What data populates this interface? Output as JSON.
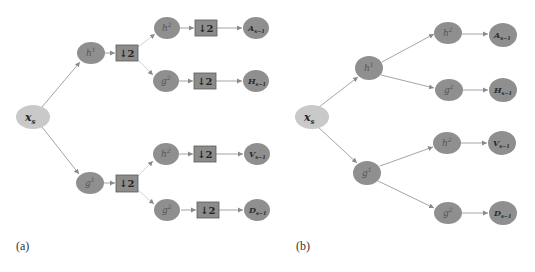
{
  "colors": {
    "input_node_fill": "#c9c9c9",
    "node_fill": "#8f8f8f",
    "downsample_box_fill": "#8c8c8c",
    "downsample_box_stroke": "#5a5a5a",
    "edge_color": "#9a9a9a",
    "edge_light": "#cfcfcf"
  },
  "panels": [
    {
      "label": "(a)",
      "input": {
        "label": "x",
        "sub": "s"
      },
      "level1": [
        {
          "id": "h1",
          "label": "h",
          "sup": "1",
          "downsample": "2"
        },
        {
          "id": "g1",
          "label": "g",
          "sup": "1",
          "downsample": "2"
        }
      ],
      "level2": [
        {
          "id": "h2a",
          "label": "h",
          "sup": "2",
          "downsample": "2",
          "output": {
            "label": "A",
            "sub": "s−1"
          }
        },
        {
          "id": "g2a",
          "label": "g",
          "sup": "2",
          "downsample": "2",
          "output": {
            "label": "H",
            "sub": "s−1"
          }
        },
        {
          "id": "h2b",
          "label": "h",
          "sup": "2",
          "downsample": "2",
          "output": {
            "label": "V",
            "sub": "s−1"
          }
        },
        {
          "id": "g2b",
          "label": "g",
          "sup": "2",
          "downsample": "2",
          "output": {
            "label": "D",
            "sub": "s−1"
          }
        }
      ]
    },
    {
      "label": "(b)",
      "input": {
        "label": "x",
        "sub": "s"
      },
      "level1": [
        {
          "id": "h1",
          "label": "h",
          "sup": "1"
        },
        {
          "id": "g1",
          "label": "g",
          "sup": "1"
        }
      ],
      "level2": [
        {
          "id": "h2a",
          "label": "h",
          "sup": "2",
          "output": {
            "label": "A",
            "sub": "s−1"
          }
        },
        {
          "id": "g2a",
          "label": "g",
          "sup": "2",
          "output": {
            "label": "H",
            "sub": "s−1"
          }
        },
        {
          "id": "h2b",
          "label": "h",
          "sup": "2",
          "output": {
            "label": "V",
            "sub": "s−1"
          }
        },
        {
          "id": "g2b",
          "label": "g",
          "sup": "2",
          "output": {
            "label": "D",
            "sub": "s−1"
          }
        }
      ]
    }
  ],
  "downsample_symbol": "↓"
}
